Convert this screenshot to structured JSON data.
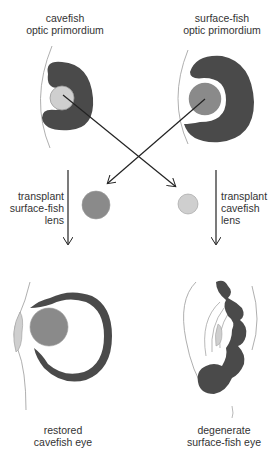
{
  "colors": {
    "tissue": "#4a4a4a",
    "cavefish_lens": "#cfcfcf",
    "surface_lens": "#8a8a8a",
    "outline": "#9a9a9a",
    "arrow": "#222222",
    "text": "#333333"
  },
  "labels": {
    "cavefish_primordium": [
      "cavefish",
      "optic primordium"
    ],
    "surface_primordium": [
      "surface-fish",
      "optic primordium"
    ],
    "transplant_surface": [
      "transplant",
      "surface-fish",
      "lens"
    ],
    "transplant_cave": [
      "transplant",
      "cavefish",
      "lens"
    ],
    "restored_eye": [
      "restored",
      "cavefish eye"
    ],
    "degenerate_eye": [
      "degenerate",
      "surface-fish eye"
    ]
  }
}
